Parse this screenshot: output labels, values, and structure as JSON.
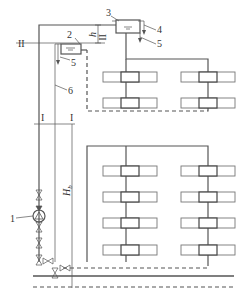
{
  "diagram": {
    "type": "heating-system-schematic",
    "labels": {
      "pump": "1",
      "lower_tank": "2",
      "upper_tank": "3",
      "overflow_upper": "4",
      "drain_upper": "5",
      "drain_lower": "5",
      "connecting_pipe": "6",
      "section_II_left": "II",
      "section_II_right": "II",
      "section_I_left": "I",
      "section_I_right": "I",
      "height_h": "h",
      "height_Hb": "H"
    },
    "height_Hb_sub": "b",
    "risers": 2,
    "upper_zone_radiators_per_riser": 3,
    "lower_zone_radiators_per_riser": 4,
    "colors": {
      "line": "#555555",
      "background": "#ffffff"
    }
  }
}
